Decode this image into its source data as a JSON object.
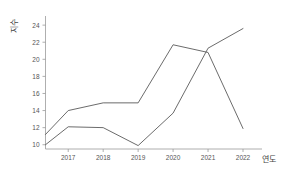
{
  "chart_data": {
    "type": "line",
    "title": "",
    "xlabel": "연도",
    "ylabel": "지수",
    "categories": [
      "2017",
      "2018",
      "2019",
      "2020",
      "2021",
      "2022"
    ],
    "xlim": [
      2016.35,
      2022.0
    ],
    "ylim": [
      9.5,
      24.6
    ],
    "xticks": [
      "2017",
      "2018",
      "2019",
      "2020",
      "2021",
      "2022"
    ],
    "yticks": [
      "10",
      "12",
      "14",
      "16",
      "18",
      "20",
      "22",
      "24"
    ],
    "grid": false,
    "legend": "none",
    "series": [
      {
        "name": "series-1",
        "color": "#5a5a5a",
        "x": [
          2016.35,
          2017,
          2018,
          2019,
          2020,
          2021,
          2022
        ],
        "values": [
          11.2,
          14.0,
          14.9,
          14.9,
          21.7,
          20.8,
          11.9
        ]
      },
      {
        "name": "series-2",
        "color": "#5a5a5a",
        "x": [
          2016.35,
          2017,
          2018,
          2019,
          2020,
          2021,
          2022
        ],
        "values": [
          10.0,
          12.1,
          12.0,
          9.9,
          13.7,
          21.3,
          23.6
        ]
      }
    ]
  },
  "axis": {
    "y_label": "지수",
    "x_label": "연도"
  }
}
